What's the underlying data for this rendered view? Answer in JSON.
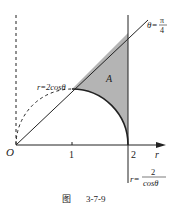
{
  "figure": {
    "caption_prefix": "图",
    "caption_number": "3-7-9",
    "origin_label": "O",
    "axis_label": "r",
    "ticks": [
      "1",
      "2"
    ],
    "region_label": "A",
    "curve_circle_label": "r=2cosθ",
    "ray_label_lhs": "θ=",
    "ray_label_num": "π",
    "ray_label_den": "4",
    "line_label_lhs": "r=",
    "line_label_num": "2",
    "line_label_den": "cosθ",
    "colors": {
      "stroke": "#222222",
      "shade": "#b4b4b4"
    }
  }
}
